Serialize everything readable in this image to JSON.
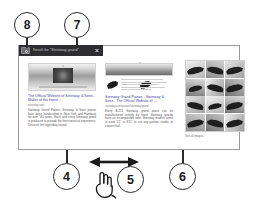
{
  "figure": {
    "type": "patent-figure",
    "callouts": [
      {
        "id": "8",
        "label": "8",
        "target": "search-icon-button"
      },
      {
        "id": "7",
        "label": "7",
        "target": "search-query-bar"
      },
      {
        "id": "4",
        "label": "4",
        "target": "web-result-card"
      },
      {
        "id": "5",
        "label": "5",
        "target": "swipe-gesture"
      },
      {
        "id": "6",
        "label": "6",
        "target": "image-results-panel"
      }
    ]
  },
  "search": {
    "query_text": "Result for \"Steinway grand\"",
    "placeholder": "Search",
    "icon": "search-icon",
    "clear_icon": "close-icon",
    "bar_color": "#2e2e30",
    "text_color": "#c9c9d0"
  },
  "results": {
    "cards": [
      {
        "title": "The Official Website of Steinway & Sons - Maker of the finest ...",
        "url": "steinway.com",
        "snippet": "Steinway Grand Pianos. Steinway & Sons pianos have been handcrafted in New York and Hamburg for over 160 years. Each and every Steinway piano is produced to provide the finest musical experience. Discover the legendary sound.",
        "thumb": "storefront-photo"
      },
      {
        "title": "Steinway Grand Pianos - Steinway & Sons - The Official Website of ...",
        "url": "steinway.com/pianos/steinway/grand",
        "snippet": "Every B-211 Steinway grand piano can be manufactured entirely by hand. Steinway grands have an incomparable tone. Steinway models come in sizes 5'1\" to 8'11\" to suit any parlour, studio, or concert hall.",
        "thumb": "concert-hall-banner"
      }
    ]
  },
  "image_panel": {
    "caption": "See all images",
    "tile_count": 12,
    "tile_alt": "grand-piano-photo"
  },
  "gesture": {
    "label": "swipe-horizontal",
    "arrow_icon": "double-arrow-horizontal-icon",
    "hand_icon": "pointing-hand-icon"
  },
  "colors": {
    "frame_border": "#9a9aa0",
    "link": "#3b3b8f",
    "body_text": "#555555",
    "url_text": "#7a7a7a",
    "ink": "#2b2b2b"
  }
}
